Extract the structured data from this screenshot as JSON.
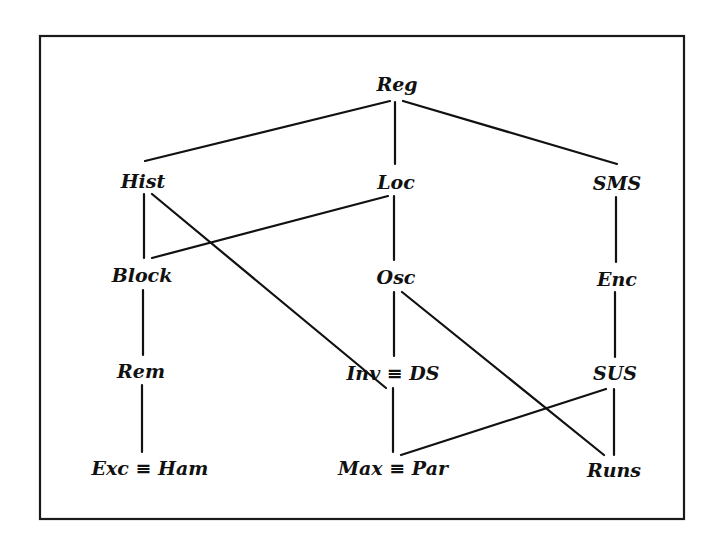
{
  "diagram": {
    "type": "hierarchy-lattice",
    "frame": {
      "x1": 40,
      "y1": 36,
      "x2": 684,
      "y2": 519
    },
    "colors": {
      "ink": "#111111",
      "background": "#ffffff"
    },
    "nodes": [
      {
        "id": "reg",
        "label": "Reg",
        "x": 397,
        "y": 91
      },
      {
        "id": "hist",
        "label": "Hist",
        "x": 143,
        "y": 188
      },
      {
        "id": "loc",
        "label": "Loc",
        "x": 396,
        "y": 189
      },
      {
        "id": "sms",
        "label": "SMS",
        "x": 617,
        "y": 190
      },
      {
        "id": "block",
        "label": "Block",
        "x": 142,
        "y": 282
      },
      {
        "id": "osc",
        "label": "Osc",
        "x": 396,
        "y": 284
      },
      {
        "id": "enc",
        "label": "Enc",
        "x": 617,
        "y": 286
      },
      {
        "id": "rem",
        "label": "Rem",
        "x": 141,
        "y": 378
      },
      {
        "id": "invds",
        "label": "Inv ≡ DS",
        "x": 393,
        "y": 380
      },
      {
        "id": "sus",
        "label": "SUS",
        "x": 615,
        "y": 380
      },
      {
        "id": "excham",
        "label": "Exc ≡ Ham",
        "x": 150,
        "y": 475
      },
      {
        "id": "maxpar",
        "label": "Max ≡ Par",
        "x": 393,
        "y": 475
      },
      {
        "id": "runs",
        "label": "Runs",
        "x": 614,
        "y": 477
      }
    ],
    "edges": [
      {
        "from": "reg",
        "to": "hist",
        "x1": 390,
        "y1": 101,
        "x2": 145,
        "y2": 161
      },
      {
        "from": "reg",
        "to": "loc",
        "x1": 395,
        "y1": 102,
        "x2": 395,
        "y2": 164
      },
      {
        "from": "reg",
        "to": "sms",
        "x1": 403,
        "y1": 101,
        "x2": 617,
        "y2": 164
      },
      {
        "from": "hist",
        "to": "block",
        "x1": 144,
        "y1": 194,
        "x2": 144,
        "y2": 258
      },
      {
        "from": "hist",
        "to": "invds",
        "x1": 152,
        "y1": 194,
        "x2": 386,
        "y2": 388
      },
      {
        "from": "loc",
        "to": "block",
        "x1": 388,
        "y1": 196,
        "x2": 152,
        "y2": 258
      },
      {
        "from": "loc",
        "to": "osc",
        "x1": 394,
        "y1": 196,
        "x2": 394,
        "y2": 260
      },
      {
        "from": "sms",
        "to": "enc",
        "x1": 616,
        "y1": 197,
        "x2": 616,
        "y2": 262
      },
      {
        "from": "block",
        "to": "rem",
        "x1": 143,
        "y1": 290,
        "x2": 143,
        "y2": 355
      },
      {
        "from": "osc",
        "to": "invds",
        "x1": 394,
        "y1": 292,
        "x2": 394,
        "y2": 356
      },
      {
        "from": "osc",
        "to": "runs",
        "x1": 402,
        "y1": 292,
        "x2": 604,
        "y2": 455
      },
      {
        "from": "enc",
        "to": "sus",
        "x1": 615,
        "y1": 292,
        "x2": 615,
        "y2": 357
      },
      {
        "from": "rem",
        "to": "excham",
        "x1": 142,
        "y1": 385,
        "x2": 142,
        "y2": 452
      },
      {
        "from": "invds",
        "to": "maxpar",
        "x1": 393,
        "y1": 388,
        "x2": 393,
        "y2": 452
      },
      {
        "from": "sus",
        "to": "maxpar",
        "x1": 606,
        "y1": 389,
        "x2": 401,
        "y2": 455
      },
      {
        "from": "sus",
        "to": "runs",
        "x1": 614,
        "y1": 389,
        "x2": 614,
        "y2": 455
      }
    ]
  }
}
